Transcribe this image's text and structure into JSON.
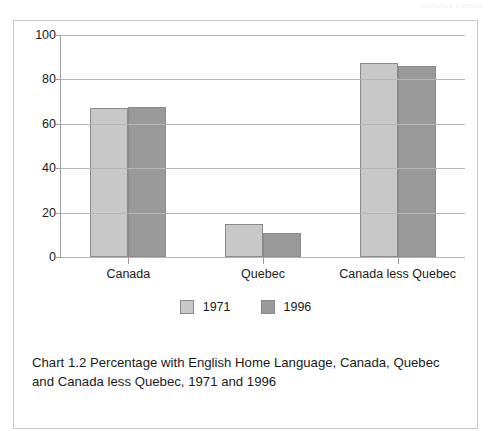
{
  "page": {
    "header_ghost": "Statistics Canada"
  },
  "chart_data": {
    "type": "bar",
    "title": "",
    "categories": [
      "Canada",
      "Quebec",
      "Canada less Quebec"
    ],
    "series": [
      {
        "name": "1971",
        "color": "#c8c8c8",
        "values": [
          67,
          15,
          87.5
        ]
      },
      {
        "name": "1996",
        "color": "#9a9a9a",
        "values": [
          67.5,
          11,
          86
        ]
      }
    ],
    "xlabel": "",
    "ylabel": "",
    "ylim": [
      0,
      100
    ],
    "yticks": [
      0,
      20,
      40,
      60,
      80,
      100
    ],
    "ytick_labels": [
      "0",
      "20",
      "40",
      "60",
      "80",
      "100"
    ],
    "grid": true,
    "legend_position": "bottom-center",
    "caption": "Chart 1.2 Percentage with English Home Language, Canada, Quebec and Canada less Quebec, 1971 and 1996"
  }
}
